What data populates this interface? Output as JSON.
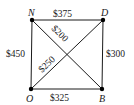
{
  "diagram": {
    "type": "weighted-complete-graph",
    "vertices": [
      {
        "id": "N",
        "label": "N",
        "x": 32,
        "y": 20
      },
      {
        "id": "D",
        "label": "D",
        "x": 103,
        "y": 20
      },
      {
        "id": "O",
        "label": "O",
        "x": 31,
        "y": 89
      },
      {
        "id": "B",
        "label": "B",
        "x": 102,
        "y": 89
      }
    ],
    "edges": [
      {
        "from": "N",
        "to": "D",
        "weight": "$375"
      },
      {
        "from": "N",
        "to": "O",
        "weight": "$450"
      },
      {
        "from": "D",
        "to": "B",
        "weight": "$300"
      },
      {
        "from": "O",
        "to": "B",
        "weight": "$325"
      },
      {
        "from": "N",
        "to": "B",
        "weight": "$200"
      },
      {
        "from": "O",
        "to": "D",
        "weight": "$250"
      }
    ]
  },
  "labels": {
    "N": "N",
    "D": "D",
    "O": "O",
    "B": "B",
    "ND": "$375",
    "NO": "$450",
    "DB": "$300",
    "OB": "$325",
    "NB": "$200",
    "OD": "$250"
  },
  "colors": {
    "line": "#1a1a1a",
    "vertex": "#000000",
    "background": "#ffffff"
  }
}
